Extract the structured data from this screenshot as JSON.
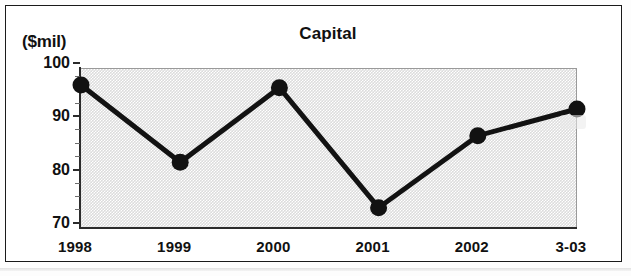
{
  "figure": {
    "unit_label": "($mil)",
    "title": "Capital"
  },
  "chart_data": {
    "type": "line",
    "title": "Capital",
    "subtitle": "",
    "xlabel": "",
    "ylabel": "($mil)",
    "categories": [
      "1998",
      "1999",
      "2000",
      "2001",
      "2002",
      "3-03"
    ],
    "values": [
      97,
      82.5,
      96.5,
      74,
      87.5,
      92.5
    ],
    "series": [
      {
        "name": "Capital",
        "values": [
          97,
          82.5,
          96.5,
          74,
          87.5,
          92.5
        ]
      }
    ],
    "ylim": [
      70,
      100
    ],
    "yticks": [
      70,
      80,
      90,
      100
    ],
    "ytick_labels": [
      "70",
      "80",
      "90",
      "100"
    ],
    "minor_tick_step": 2.5,
    "xtick_labels": [
      "1998",
      "1999",
      "2000",
      "2001",
      "2002",
      "3-03"
    ],
    "grid": false,
    "legend": "none",
    "plot_background": "#dcdcdc",
    "line_color": "#121212",
    "marker": "circle"
  }
}
